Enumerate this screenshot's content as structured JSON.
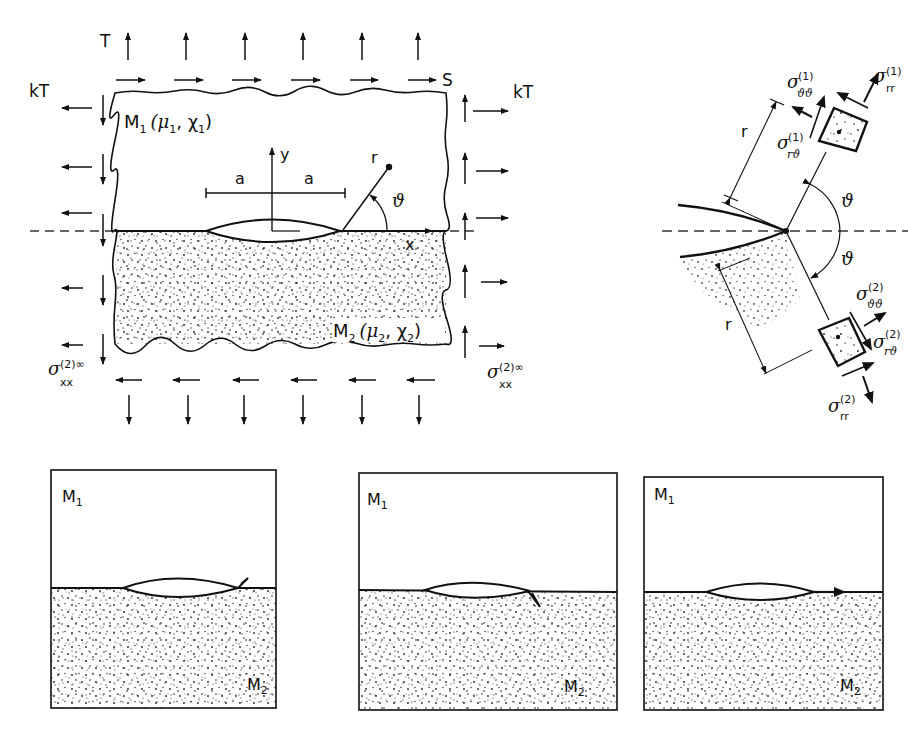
{
  "figure": {
    "main_panel": {
      "labels": {
        "top_load": "T",
        "shear_load": "S",
        "left_lateral": "kT",
        "right_lateral": "kT",
        "material_top": "M",
        "material_top_sub": "1",
        "material_top_params": "(μ",
        "material_top_params_sub1": "1",
        "material_top_params_mid": ", χ",
        "material_top_params_sub2": "1",
        "material_top_params_end": ")",
        "material_bottom": "M",
        "material_bottom_sub": "2",
        "material_bottom_params": "(μ",
        "material_bottom_params_sub1": "2",
        "material_bottom_params_mid": ", χ",
        "material_bottom_params_sub2": "2",
        "material_bottom_params_end": ")",
        "axis_x": "x",
        "axis_y": "y",
        "half_length_left": "a",
        "half_length_right": "a",
        "radius": "r",
        "angle": "ϑ",
        "far_field_stress_left": "σ",
        "far_field_stress_left_sup": "(2)∞",
        "far_field_stress_left_sub": "xx",
        "far_field_stress_right": "σ",
        "far_field_stress_right_sup": "(2)∞",
        "far_field_stress_right_sub": "xx"
      }
    },
    "tip_detail": {
      "labels": {
        "radius_top": "r",
        "radius_bottom": "r",
        "angle_top": "ϑ",
        "angle_bottom": "ϑ",
        "sigma_tt_1": "σ",
        "sigma_tt_1_sup": "(1)",
        "sigma_tt_1_sub": "ϑϑ",
        "sigma_rr_1": "σ",
        "sigma_rr_1_sup": "(1)",
        "sigma_rr_1_sub": "rr",
        "sigma_rt_1": "σ",
        "sigma_rt_1_sup": "(1)",
        "sigma_rt_1_sub": "rϑ",
        "sigma_tt_2": "σ",
        "sigma_tt_2_sup": "(2)",
        "sigma_tt_2_sub": "ϑϑ",
        "sigma_rt_2": "σ",
        "sigma_rt_2_sup": "(2)",
        "sigma_rt_2_sub": "rϑ",
        "sigma_rr_2": "σ",
        "sigma_rr_2_sup": "(2)",
        "sigma_rr_2_sub": "rr"
      }
    },
    "crack_paths": [
      {
        "id": "kink-into-m1",
        "top_label": "M",
        "top_sub": "1",
        "bottom_label": "M",
        "bottom_sub": "2",
        "direction": "up-into-M1"
      },
      {
        "id": "kink-into-m2",
        "top_label": "M",
        "top_sub": "1",
        "bottom_label": "M",
        "bottom_sub": "2",
        "direction": "down-into-M2"
      },
      {
        "id": "along-interface",
        "top_label": "M",
        "top_sub": "1",
        "bottom_label": "M",
        "bottom_sub": "2",
        "direction": "along-interface"
      }
    ],
    "colors": {
      "ink": "#111111",
      "background": "#ffffff",
      "dash": "#333333"
    }
  }
}
